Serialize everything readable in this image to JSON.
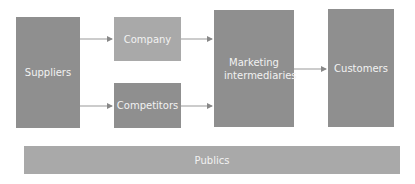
{
  "diagram": {
    "nodes": [
      {
        "id": "suppliers",
        "label": "Suppliers"
      },
      {
        "id": "company",
        "label": "Company"
      },
      {
        "id": "competitors",
        "label": "Competitors"
      },
      {
        "id": "intermediaries",
        "label": "Marketing intermediaries"
      },
      {
        "id": "customers",
        "label": "Customers"
      },
      {
        "id": "publics",
        "label": "Publics"
      }
    ],
    "edges": [
      {
        "from": "suppliers",
        "to": "company"
      },
      {
        "from": "suppliers",
        "to": "competitors"
      },
      {
        "from": "company",
        "to": "intermediaries"
      },
      {
        "from": "competitors",
        "to": "intermediaries"
      },
      {
        "from": "intermediaries",
        "to": "customers"
      }
    ],
    "colors": {
      "box_dark": "#8f8f8f",
      "box_mid": "#9c9c9c",
      "box_light": "#a9a9a9",
      "arrow": "#888888",
      "text": "#f2f2f2"
    }
  }
}
